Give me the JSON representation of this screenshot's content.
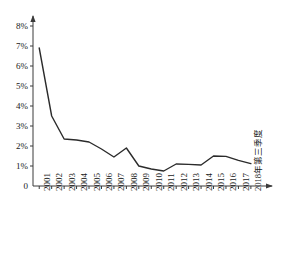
{
  "chart_data": {
    "type": "line",
    "title": "",
    "subtitle": "",
    "xlabel": "",
    "ylabel": "",
    "ylim": [
      0,
      8.4
    ],
    "grid": false,
    "legend": false,
    "legend_position": "none",
    "line_color": "#2b2b2b",
    "axis_color": "#3a3a3a",
    "y_tick_labels": [
      "8%",
      "7%",
      "6%",
      "5%",
      "4%",
      "3%",
      "2%",
      "1%",
      "0"
    ],
    "y_tick_values": [
      8,
      7,
      6,
      5,
      4,
      3,
      2,
      1,
      0
    ],
    "categories": [
      "2001",
      "2002",
      "2003",
      "2004",
      "2005",
      "2006",
      "2007",
      "2008",
      "2009",
      "2010",
      "2011",
      "2012",
      "2013",
      "2014",
      "2015",
      "2016",
      "2017",
      "2018年第三季度"
    ],
    "values": [
      6.9,
      3.5,
      2.35,
      2.3,
      2.2,
      1.85,
      1.45,
      1.9,
      1.0,
      0.85,
      0.75,
      1.1,
      1.08,
      1.05,
      1.5,
      1.48,
      1.28,
      1.12
    ],
    "series": [
      {
        "name": "",
        "values": [
          6.9,
          3.5,
          2.35,
          2.3,
          2.2,
          1.85,
          1.45,
          1.9,
          1.0,
          0.85,
          0.75,
          1.1,
          1.08,
          1.05,
          1.5,
          1.48,
          1.28,
          1.12
        ]
      }
    ],
    "annotations": []
  }
}
